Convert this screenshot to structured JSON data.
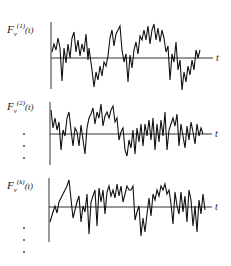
{
  "figure": {
    "panels": [
      {
        "label_base": "F",
        "label_sub": "v",
        "label_sup": "(1)",
        "label_arg": "(t)",
        "axis_label": "t"
      },
      {
        "label_base": "F",
        "label_sub": "v",
        "label_sup": "(2)",
        "label_arg": "(t)",
        "axis_label": "t"
      },
      {
        "label_base": "F",
        "label_sub": "v",
        "label_sup": "(k)",
        "label_arg": "(t)",
        "axis_label": "t"
      }
    ],
    "ellipsis_groups": [
      {
        "glyph": "·",
        "count": 3
      },
      {
        "glyph": "·",
        "count": 3
      }
    ]
  },
  "colors": {
    "ink": "#111111",
    "background": "#ffffff"
  }
}
